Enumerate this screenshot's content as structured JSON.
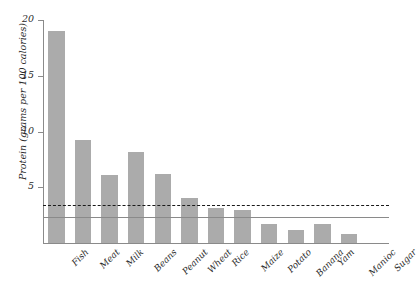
{
  "chart_data": {
    "type": "bar",
    "title": "",
    "xlabel": "",
    "ylabel": "Protein (grams per 100 calories)",
    "ylim": [
      0,
      20
    ],
    "yticks": [
      5,
      10,
      15,
      20
    ],
    "ytick_labels": [
      "5",
      "10",
      "15",
      "20"
    ],
    "grid": false,
    "legend": "none",
    "categories": [
      "Fish",
      "Meat",
      "Milk",
      "Beans",
      "Peanut",
      "Wheat",
      "Rice",
      "Maize",
      "Potato",
      "Banana",
      "Yam",
      "Manioc",
      "Sugar"
    ],
    "values": [
      19.0,
      9.2,
      6.1,
      8.2,
      6.2,
      4.0,
      3.1,
      3.0,
      1.7,
      1.2,
      1.7,
      0.8,
      0.0
    ],
    "bar_color": "#ababab",
    "reference_lines": [
      {
        "name": "dashed-requirement-line",
        "value": 3.4,
        "style": "dashed",
        "color": "#1a1a1a"
      },
      {
        "name": "solid-requirement-line",
        "value": 2.3,
        "style": "solid",
        "color": "#8a8a8a"
      }
    ],
    "axis_color": "#8a8a8a",
    "text_color": "#2b2b2b"
  }
}
